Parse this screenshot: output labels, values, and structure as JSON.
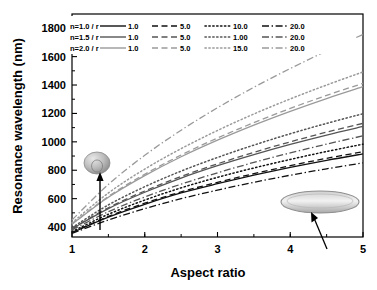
{
  "chart_data": {
    "type": "line",
    "title": "",
    "xlabel": "Aspect ratio",
    "ylabel": "Resonance wavelength (nm)",
    "xlim": [
      1,
      5
    ],
    "ylim": [
      330,
      1900
    ],
    "xticks": [
      1,
      2,
      3,
      4,
      5
    ],
    "yticks": [
      400,
      600,
      800,
      1000,
      1200,
      1400,
      1600,
      1800
    ],
    "grid": false,
    "legend_position": "top-left",
    "legend_header_col": "n / r",
    "legend_groups": [
      {
        "label": "n=1.0 / r",
        "color": "#111111",
        "entries": [
          {
            "r": "1.0",
            "style": "solid"
          },
          {
            "r": "5.0",
            "style": "dashed"
          },
          {
            "r": "10.0",
            "style": "dotted"
          },
          {
            "r": "20.0",
            "style": "dashdot"
          }
        ]
      },
      {
        "label": "n=1.5 / r",
        "color": "#555555",
        "entries": [
          {
            "r": "1.0",
            "style": "solid"
          },
          {
            "r": "5.0",
            "style": "dashed"
          },
          {
            "r": "1.00",
            "style": "dotted"
          },
          {
            "r": "20.0",
            "style": "dashdot"
          }
        ]
      },
      {
        "label": "n=2.0 / r",
        "color": "#9a9a9a",
        "entries": [
          {
            "r": "1.0",
            "style": "solid"
          },
          {
            "r": "5.0",
            "style": "dashed"
          },
          {
            "r": "15.0",
            "style": "dotted"
          },
          {
            "r": "20.0",
            "style": "dashdot"
          }
        ]
      }
    ],
    "x": [
      1.0,
      1.5,
      2.0,
      2.5,
      3.0,
      3.5,
      4.0,
      4.5,
      5.0
    ],
    "series": [
      {
        "name": "n=1.0 r=1.0",
        "group": "n=1.0",
        "style": "solid",
        "color": "#111111",
        "values": [
          360,
          470,
          560,
          640,
          705,
          765,
          820,
          870,
          915
        ]
      },
      {
        "name": "n=1.0 r=5.0",
        "group": "n=1.0",
        "style": "dashed",
        "color": "#111111",
        "values": [
          362,
          475,
          568,
          648,
          715,
          776,
          832,
          884,
          930
        ]
      },
      {
        "name": "n=1.0 r=10.0",
        "group": "n=1.0",
        "style": "dotted",
        "color": "#111111",
        "values": [
          368,
          490,
          590,
          676,
          750,
          816,
          876,
          932,
          983
        ]
      },
      {
        "name": "n=1.0 r=20.0",
        "group": "n=1.0",
        "style": "dashdot",
        "color": "#111111",
        "values": [
          355,
          450,
          530,
          600,
          660,
          715,
          765,
          810,
          852
        ]
      },
      {
        "name": "n=1.5 r=1.0",
        "group": "n=1.5",
        "style": "solid",
        "color": "#555555",
        "values": [
          388,
          530,
          645,
          745,
          832,
          910,
          982,
          1048,
          1108
        ]
      },
      {
        "name": "n=1.5 r=5.0",
        "group": "n=1.5",
        "style": "dashed",
        "color": "#555555",
        "values": [
          390,
          536,
          654,
          756,
          845,
          926,
          1000,
          1068,
          1130
        ]
      },
      {
        "name": "n=1.5 r=1.00",
        "group": "n=1.5",
        "style": "dotted",
        "color": "#555555",
        "values": [
          396,
          556,
          684,
          794,
          890,
          977,
          1057,
          1130,
          1198
        ]
      },
      {
        "name": "n=1.5 r=20.0",
        "group": "n=1.5",
        "style": "dashdot",
        "color": "#555555",
        "values": [
          380,
          508,
          612,
          702,
          782,
          855,
          922,
          984,
          1042
        ]
      },
      {
        "name": "n=2.0 r=1.0",
        "group": "n=2.0",
        "style": "solid",
        "color": "#9a9a9a",
        "values": [
          420,
          610,
          762,
          895,
          1012,
          1118,
          1215,
          1305,
          1388
        ]
      },
      {
        "name": "n=2.0 r=5.0",
        "group": "n=2.0",
        "style": "dashed",
        "color": "#9a9a9a",
        "values": [
          422,
          616,
          772,
          907,
          1027,
          1135,
          1235,
          1327,
          1412
        ]
      },
      {
        "name": "n=2.0 r=15.0",
        "group": "n=2.0",
        "style": "dotted",
        "color": "#9a9a9a",
        "values": [
          430,
          640,
          808,
          952,
          1080,
          1196,
          1302,
          1400,
          1492
        ]
      },
      {
        "name": "n=2.0 r=20.0",
        "group": "n=2.0",
        "style": "dashdot",
        "color": "#9a9a9a",
        "values": [
          450,
          700,
          905,
          1082,
          1240,
          1384,
          1516,
          1640,
          1756
        ]
      }
    ],
    "annotations": [
      {
        "name": "sphere-inset",
        "shape": "sphere",
        "note": "low aspect ratio particle"
      },
      {
        "name": "ellipsoid-inset",
        "shape": "ellipsoid",
        "note": "high aspect ratio particle"
      }
    ]
  }
}
